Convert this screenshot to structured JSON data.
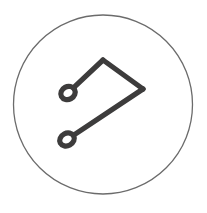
{
  "canvas": {
    "width": 207,
    "height": 213,
    "background_color": "#ffffff"
  },
  "icon": {
    "name": "flag-path-icon",
    "title": "Flag Path Icon",
    "description": "Hand-drawn flag / path glyph enclosed in a thin circular outline",
    "stroke_color": "#3d3c3c",
    "stroke_width": 5.2,
    "frame": {
      "name": "circle-frame",
      "shape": "circle",
      "center_x": 103,
      "center_y": 104.5,
      "radius": 89.5,
      "stroke_color": "#6b6b6b",
      "stroke_width": 1.3,
      "fill": "none"
    },
    "nodes": [
      {
        "name": "upper-loop-node",
        "center_x": 68,
        "center_y": 93,
        "radius_x": 7.4,
        "radius_y": 6.4,
        "rotation_deg": -28
      },
      {
        "name": "lower-loop-node",
        "center_x": 67,
        "center_y": 139.5,
        "radius_x": 7.6,
        "radius_y": 6.2,
        "rotation_deg": -28
      }
    ],
    "vertices": {
      "top_apex_x": 103,
      "top_apex_y": 60,
      "right_apex_x": 143,
      "right_apex_y": 89
    },
    "path_segments": [
      {
        "name": "upper-node-to-apex",
        "from": "upper-loop-node",
        "to": "top-apex"
      },
      {
        "name": "apex-to-right-vertex",
        "from": "top-apex",
        "to": "right-apex"
      },
      {
        "name": "right-vertex-to-lower-node",
        "from": "right-apex",
        "to": "lower-loop-node"
      }
    ]
  }
}
